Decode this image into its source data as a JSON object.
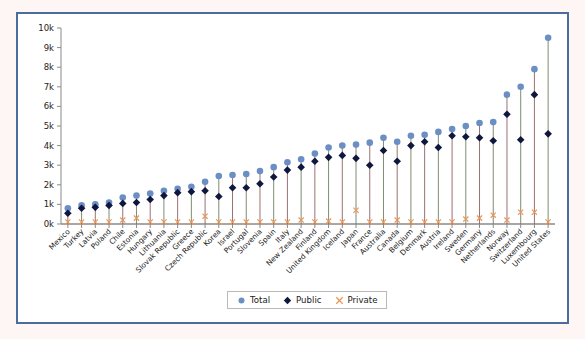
{
  "figure": {
    "frame_border_color": "#4a6d9e",
    "outer_background": "#fdf6f4",
    "plot_background": "#ffffff"
  },
  "legend": {
    "position": "bottom-center",
    "entries": [
      {
        "label": "Total",
        "marker": "circle-marker",
        "color": "#6b8fc4"
      },
      {
        "label": "Public",
        "marker": "diamond-marker",
        "color": "#10173f"
      },
      {
        "label": "Private",
        "marker": "x-marker",
        "color": "#e8965a"
      }
    ]
  },
  "chart_data": {
    "type": "scatter",
    "title": "",
    "subtitle": "",
    "xlabel": "",
    "ylabel": "",
    "ylim": [
      0,
      10000
    ],
    "grid": false,
    "legend_position": "bottom-center",
    "ytick_labels": [
      "0k",
      "1k",
      "2k",
      "3k",
      "4k",
      "5k",
      "6k",
      "7k",
      "8k",
      "9k",
      "10k"
    ],
    "ytick_values": [
      0,
      1000,
      2000,
      3000,
      4000,
      5000,
      6000,
      7000,
      8000,
      9000,
      10000
    ],
    "categories": [
      "Mexico",
      "Turkey",
      "Latvia",
      "Poland",
      "Chile",
      "Estonia",
      "Hungary",
      "Lithuania",
      "Slovak Republic",
      "Greece",
      "Czech Republic",
      "Korea",
      "Israel",
      "Portugal",
      "Slovenia",
      "Spain",
      "Italy",
      "New Zealand",
      "Finland",
      "United Kingdom",
      "Iceland",
      "Japan",
      "France",
      "Australia",
      "Canada",
      "Belgium",
      "Denmark",
      "Austria",
      "Ireland",
      "Sweden",
      "Germany",
      "Netherlands",
      "Norway",
      "Switzerland",
      "Luxembourg",
      "United States"
    ],
    "series": [
      {
        "name": "Total",
        "marker": "circle",
        "color": "#6b8fc4",
        "values": [
          800,
          950,
          1000,
          1100,
          1350,
          1450,
          1550,
          1700,
          1800,
          1900,
          2150,
          2450,
          2500,
          2550,
          2700,
          2900,
          3150,
          3300,
          3600,
          3900,
          4000,
          4050,
          4150,
          4400,
          4200,
          4500,
          4550,
          4700,
          4850,
          5000,
          5150,
          5200,
          6600,
          7000,
          7900,
          9500
        ]
      },
      {
        "name": "Public",
        "marker": "diamond",
        "color": "#10173f",
        "values": [
          550,
          800,
          850,
          950,
          1050,
          1100,
          1250,
          1450,
          1600,
          1650,
          1700,
          1400,
          1850,
          1850,
          2050,
          2400,
          2750,
          2900,
          3200,
          3400,
          3500,
          3350,
          3000,
          3750,
          3200,
          4000,
          4200,
          3900,
          4500,
          4450,
          4400,
          4250,
          5600,
          4300,
          6600,
          4600
        ]
      },
      {
        "name": "Private",
        "marker": "x",
        "color": "#e8965a",
        "values": [
          100,
          100,
          100,
          100,
          200,
          300,
          100,
          100,
          100,
          100,
          400,
          100,
          100,
          100,
          100,
          100,
          100,
          200,
          100,
          150,
          100,
          700,
          100,
          100,
          200,
          100,
          100,
          100,
          100,
          250,
          300,
          450,
          200,
          600,
          600,
          100
        ]
      }
    ]
  }
}
